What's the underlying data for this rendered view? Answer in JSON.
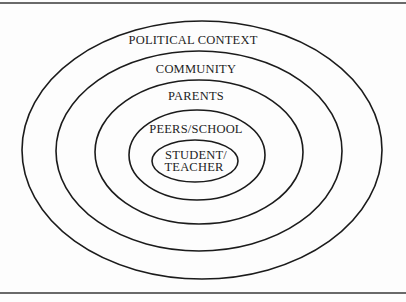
{
  "diagram": {
    "type": "concentric-ellipses",
    "stroke_color": "#1b1b1b",
    "background": "#fdfdfd",
    "rings": [
      {
        "label": "POLITICAL CONTEXT",
        "order": 1
      },
      {
        "label": "COMMUNITY",
        "order": 2
      },
      {
        "label": "PARENTS",
        "order": 3
      },
      {
        "label": "PEERS/SCHOOL",
        "order": 4
      },
      {
        "label_line1": "STUDENT/",
        "label_line2": "TEACHER",
        "order": 5
      }
    ]
  }
}
